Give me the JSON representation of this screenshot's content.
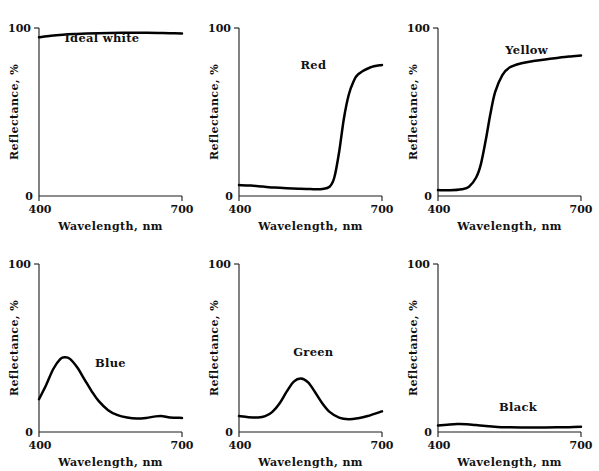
{
  "figure": {
    "background": "#ffffff",
    "curve_color": "#000000",
    "axis_color": "#1a1a1a",
    "rows": 2,
    "cols": 3
  },
  "axes": {
    "xlabel": "Wavelength, nm",
    "ylabel": "Reflectance, %",
    "xticks": [
      "400",
      "700"
    ],
    "yticks": [
      "100",
      "0"
    ],
    "xlim": [
      400,
      700
    ],
    "ylim": [
      0,
      100
    ]
  },
  "chart_data": [
    {
      "type": "line",
      "title": "Ideal white",
      "xlabel": "Wavelength, nm",
      "ylabel": "Reflectance, %",
      "xlim": [
        400,
        700
      ],
      "ylim": [
        0,
        100
      ],
      "xticks": [
        400,
        700
      ],
      "yticks": [
        0,
        100
      ],
      "grid": false,
      "legend": "none",
      "label_position": "top-center",
      "x": [
        400,
        425,
        450,
        475,
        500,
        525,
        550,
        575,
        600,
        625,
        650,
        675,
        700
      ],
      "values": [
        94.5,
        95.4,
        96.0,
        96.4,
        96.7,
        96.9,
        97.0,
        97.1,
        97.1,
        97.1,
        97.0,
        96.9,
        96.7
      ]
    },
    {
      "type": "line",
      "title": "Red",
      "xlabel": "Wavelength, nm",
      "ylabel": "Reflectance, %",
      "xlim": [
        400,
        700
      ],
      "ylim": [
        0,
        100
      ],
      "xticks": [
        400,
        700
      ],
      "yticks": [
        0,
        100
      ],
      "grid": false,
      "legend": "none",
      "label_position": "upper-middle",
      "x": [
        400,
        425,
        450,
        475,
        500,
        525,
        550,
        575,
        590,
        600,
        610,
        620,
        630,
        640,
        650,
        675,
        700
      ],
      "values": [
        6.5,
        6.2,
        5.6,
        5.0,
        4.6,
        4.3,
        4.1,
        4.2,
        5.5,
        11.0,
        26.0,
        46.0,
        60.0,
        68.0,
        72.5,
        76.5,
        78.0
      ]
    },
    {
      "type": "line",
      "title": "Yellow",
      "xlabel": "Wavelength, nm",
      "ylabel": "Reflectance, %",
      "xlim": [
        400,
        700
      ],
      "ylim": [
        0,
        100
      ],
      "xticks": [
        400,
        700
      ],
      "yticks": [
        0,
        100
      ],
      "grid": false,
      "legend": "none",
      "label_position": "upper-middle",
      "x": [
        400,
        425,
        450,
        465,
        480,
        490,
        500,
        510,
        520,
        535,
        550,
        575,
        600,
        625,
        650,
        675,
        700
      ],
      "values": [
        3.5,
        3.4,
        4.0,
        5.5,
        11.0,
        19.0,
        33.0,
        49.0,
        62.0,
        72.0,
        76.5,
        79.0,
        80.3,
        81.3,
        82.2,
        83.0,
        83.6
      ]
    },
    {
      "type": "line",
      "title": "Blue",
      "xlabel": "Wavelength, nm",
      "ylabel": "Reflectance, %",
      "xlim": [
        400,
        700
      ],
      "ylim": [
        0,
        100
      ],
      "xticks": [
        400,
        700
      ],
      "yticks": [
        0,
        100
      ],
      "grid": false,
      "legend": "none",
      "label_position": "middle-right-of-peak",
      "x": [
        400,
        415,
        430,
        445,
        455,
        465,
        480,
        495,
        510,
        525,
        545,
        565,
        585,
        605,
        625,
        645,
        660,
        675,
        700
      ],
      "values": [
        19.5,
        28.0,
        37.5,
        43.5,
        44.5,
        43.5,
        38.5,
        31.5,
        24.5,
        18.5,
        13.0,
        10.0,
        8.6,
        8.0,
        8.4,
        9.3,
        9.4,
        8.6,
        8.4
      ]
    },
    {
      "type": "line",
      "title": "Green",
      "xlabel": "Wavelength, nm",
      "ylabel": "Reflectance, %",
      "xlim": [
        400,
        700
      ],
      "ylim": [
        0,
        100
      ],
      "xticks": [
        400,
        700
      ],
      "yticks": [
        0,
        100
      ],
      "grid": false,
      "legend": "none",
      "label_position": "above-peak",
      "x": [
        400,
        420,
        440,
        455,
        470,
        485,
        500,
        515,
        530,
        545,
        560,
        575,
        590,
        610,
        630,
        650,
        670,
        700
      ],
      "values": [
        9.5,
        8.8,
        8.6,
        9.4,
        12.0,
        17.0,
        24.0,
        30.0,
        31.8,
        29.5,
        23.5,
        17.0,
        12.0,
        8.6,
        7.6,
        8.2,
        9.5,
        12.3
      ]
    },
    {
      "type": "line",
      "title": "Black",
      "xlabel": "Wavelength, nm",
      "ylabel": "Reflectance, %",
      "xlim": [
        400,
        700
      ],
      "ylim": [
        0,
        100
      ],
      "xticks": [
        400,
        700
      ],
      "yticks": [
        0,
        100
      ],
      "grid": false,
      "legend": "none",
      "label_position": "above-curve",
      "x": [
        400,
        420,
        440,
        460,
        480,
        500,
        525,
        550,
        575,
        600,
        625,
        650,
        675,
        700
      ],
      "values": [
        3.8,
        4.3,
        4.7,
        4.6,
        4.1,
        3.5,
        3.0,
        2.8,
        2.7,
        2.7,
        2.7,
        2.8,
        2.9,
        3.1
      ]
    }
  ]
}
